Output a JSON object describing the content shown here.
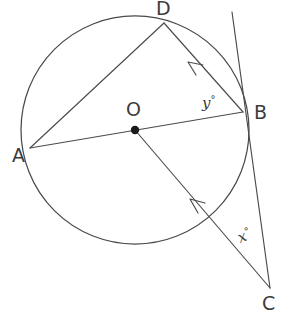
{
  "figure": {
    "background_color": "#ffffff",
    "stroke_color": "#4a4a4a",
    "label_color": "#3c3c3c",
    "center_dot_color": "#1a1a1a"
  },
  "circle": {
    "center_label": "O",
    "center_x": 135,
    "center_y": 130,
    "radius": 114
  },
  "points": [
    {
      "name": "A",
      "label": "A",
      "x": 30,
      "y": 148,
      "label_x": 12,
      "label_y": 162,
      "on_circle": true
    },
    {
      "name": "B",
      "label": "B",
      "x": 243,
      "y": 112,
      "label_x": 254,
      "label_y": 119,
      "on_circle": true
    },
    {
      "name": "C",
      "label": "C",
      "x": 270,
      "y": 288,
      "label_x": 262,
      "label_y": 310,
      "on_circle": false
    },
    {
      "name": "D",
      "label": "D",
      "x": 164,
      "y": 23,
      "label_x": 156,
      "label_y": 15,
      "on_circle": true
    },
    {
      "name": "O",
      "label": "O",
      "x": 135,
      "y": 130,
      "label_x": 126,
      "label_y": 116,
      "on_circle": false
    }
  ],
  "segments": [
    {
      "name": "chord-A-D",
      "from": "A",
      "to": "D",
      "arrow": false
    },
    {
      "name": "chord-A-B",
      "from": "A",
      "to": "B",
      "arrow": false
    },
    {
      "name": "chord-D-B",
      "from": "B",
      "to": "D",
      "arrow": true,
      "arrow_at": "D"
    },
    {
      "name": "line-C-O",
      "from": "C",
      "to": "O",
      "arrow": true,
      "arrow_at": "O"
    },
    {
      "name": "tangent-at-B",
      "from": "tangent-top",
      "to": "C",
      "arrow": false
    }
  ],
  "angles": [
    {
      "name": "angle-y",
      "symbol": "y",
      "degree_symbol": "°",
      "vertex": "B",
      "label_x": 202,
      "label_y": 108,
      "rotation": 0,
      "description": "angle between chord BD and chord BA at B"
    },
    {
      "name": "angle-x",
      "symbol": "x",
      "degree_symbol": "°",
      "vertex": "C",
      "label_x": 240,
      "label_y": 243,
      "rotation": -22,
      "description": "angle at external point C between tangent CB and line CO"
    }
  ]
}
